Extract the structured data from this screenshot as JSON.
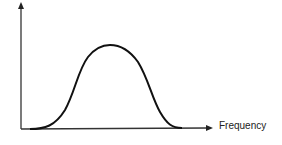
{
  "diagram": {
    "x_axis_label": "Frequency",
    "y_axis_label": "",
    "curve_type": "bell-shaped",
    "colors": {
      "axis": "#333333",
      "curve": "#111111"
    }
  }
}
